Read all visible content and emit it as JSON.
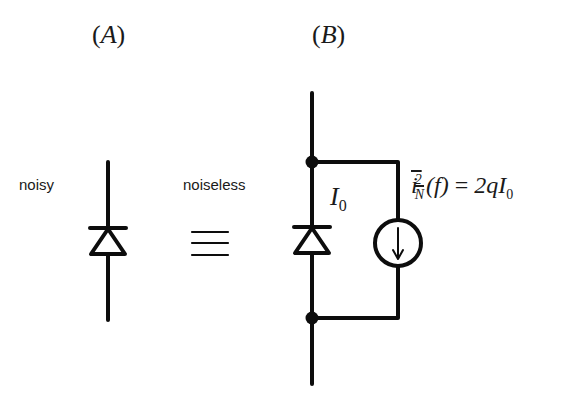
{
  "panels": {
    "a": {
      "open": "(",
      "letter": "A",
      "close": ")"
    },
    "b": {
      "open": "(",
      "letter": "B",
      "close": ")"
    }
  },
  "labels": {
    "noisy": "noisy",
    "noiseless": "noiseless",
    "equivalence_symbol": "≡"
  },
  "circuit_b": {
    "diode_current_symbol": "I",
    "diode_current_subscript": "0",
    "noise_source": {
      "lhs_symbol": "i",
      "lhs_superscript": "2",
      "lhs_subscript": "N",
      "argument": "(f)",
      "equals": " = ",
      "rhs": "2qI",
      "rhs_subscript": "0"
    }
  },
  "colors": {
    "stroke": "#0d0d0d",
    "background": "#ffffff"
  }
}
